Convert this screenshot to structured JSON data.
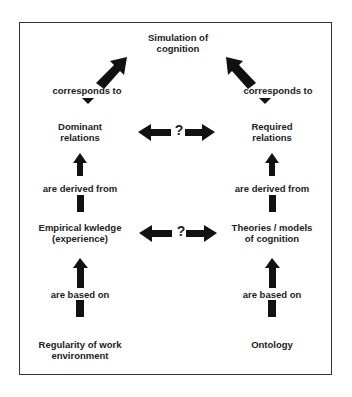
{
  "diagram": {
    "top_node": {
      "line1": "Simulation of",
      "line2": "cognition"
    },
    "left_column": {
      "corresponds": "corresponds to",
      "node1": {
        "line1": "Dominant",
        "line2": "relations"
      },
      "derived": "are derived from",
      "node2": {
        "line1": "Empirical kwledge",
        "line2": "(experience)"
      },
      "based": "are based on",
      "node3": {
        "line1": "Regularity of work",
        "line2": "environment"
      }
    },
    "right_column": {
      "corresponds": "corresponds to",
      "node1": {
        "line1": "Required",
        "line2": "relations"
      },
      "derived": "are derived from",
      "node2": {
        "line1": "Theories / models",
        "line2": "of cognition"
      },
      "based": "are based on",
      "node3": {
        "line1": "Ontology"
      }
    },
    "relation_marks": {
      "upper": "?",
      "lower": "?"
    },
    "colors": {
      "arrow": "#111111",
      "text": "#222222",
      "border": "#333333"
    }
  }
}
